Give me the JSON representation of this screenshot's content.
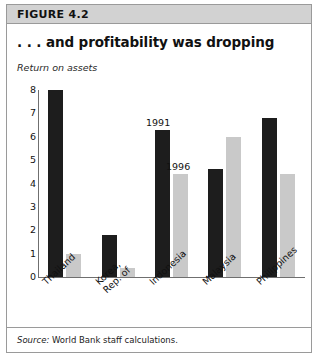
{
  "figure": {
    "number_label": "FIGURE 4.2",
    "title": ". . . and profitability was dropping",
    "subtitle": "Return on assets",
    "source_label": "Source:",
    "source_text": "World Bank staff calculations."
  },
  "colors": {
    "series_1991": "#1d1d1d",
    "series_1996": "#c9c9c9",
    "header_band": "#d2d2d2",
    "frame_border": "#9a9a9a",
    "axis": "#6f6f6f",
    "text": "#111111"
  },
  "annotations": [
    {
      "text": "1991",
      "series": "1991"
    },
    {
      "text": "1996",
      "series": "1996"
    }
  ],
  "chart_data": {
    "type": "bar",
    "title": ". . . and profitability was dropping",
    "subtitle": "Return on assets",
    "xlabel": "",
    "ylabel": "Return on assets",
    "ylim": [
      0,
      8
    ],
    "yticks": [
      0,
      1,
      2,
      3,
      4,
      5,
      6,
      7,
      8
    ],
    "ytick_labels": [
      "0",
      "1",
      "2",
      "3",
      "4",
      "5",
      "6",
      "7",
      "8"
    ],
    "grid": false,
    "legend": "inline annotations on Indonesia bars",
    "categories": [
      "Thailand",
      "Korea, Rep. of",
      "Indonesia",
      "Malaysia",
      "Philippines"
    ],
    "category_lines": [
      [
        "Thailand"
      ],
      [
        "Korea,",
        "Rep. of"
      ],
      [
        "Indonesia"
      ],
      [
        "Malaysia"
      ],
      [
        "Philippines"
      ]
    ],
    "series": [
      {
        "name": "1991",
        "color": "#1d1d1d",
        "values": [
          8.0,
          1.8,
          6.3,
          4.6,
          6.8
        ]
      },
      {
        "name": "1996",
        "color": "#c9c9c9",
        "values": [
          1.0,
          0.4,
          4.4,
          6.0,
          4.4
        ]
      }
    ]
  }
}
